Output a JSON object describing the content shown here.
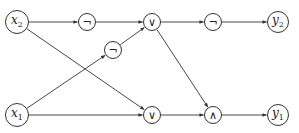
{
  "diagram": {
    "type": "boolean-circuit",
    "nodes": [
      {
        "id": "x2",
        "label": "x",
        "sub": "2",
        "kind": "input",
        "x": 17,
        "y": 22,
        "r": 12
      },
      {
        "id": "not1",
        "label": "¬",
        "kind": "gate",
        "x": 87,
        "y": 22,
        "r": 9
      },
      {
        "id": "or1",
        "label": "∨",
        "kind": "gate",
        "x": 152,
        "y": 22,
        "r": 9
      },
      {
        "id": "not3",
        "label": "¬",
        "kind": "gate",
        "x": 213,
        "y": 22,
        "r": 9
      },
      {
        "id": "y2",
        "label": "y",
        "sub": "2",
        "kind": "output",
        "x": 278,
        "y": 22,
        "r": 11
      },
      {
        "id": "not2",
        "label": "¬",
        "kind": "gate",
        "x": 113,
        "y": 50,
        "r": 9
      },
      {
        "id": "x1",
        "label": "x",
        "sub": "1",
        "kind": "input",
        "x": 17,
        "y": 115,
        "r": 12
      },
      {
        "id": "or2",
        "label": "∨",
        "kind": "gate",
        "x": 152,
        "y": 115,
        "r": 9
      },
      {
        "id": "and1",
        "label": "∧",
        "kind": "gate",
        "x": 213,
        "y": 115,
        "r": 9
      },
      {
        "id": "y1",
        "label": "y",
        "sub": "1",
        "kind": "output",
        "x": 278,
        "y": 115,
        "r": 11
      }
    ],
    "edges": [
      {
        "from": "x2",
        "to": "not1"
      },
      {
        "from": "x2",
        "to": "or2"
      },
      {
        "from": "not1",
        "to": "or1"
      },
      {
        "from": "x1",
        "to": "not2"
      },
      {
        "from": "not2",
        "to": "or1"
      },
      {
        "from": "x1",
        "to": "or2"
      },
      {
        "from": "or1",
        "to": "not3"
      },
      {
        "from": "or1",
        "to": "and1"
      },
      {
        "from": "not3",
        "to": "y2"
      },
      {
        "from": "or2",
        "to": "and1"
      },
      {
        "from": "and1",
        "to": "y1"
      }
    ]
  },
  "labels": {
    "x2": "x",
    "x2_sub": "2",
    "x1": "x",
    "x1_sub": "1",
    "y2": "y",
    "y2_sub": "2",
    "y1": "y",
    "y1_sub": "1",
    "not1": "¬",
    "not2": "¬",
    "not3": "¬",
    "or1": "∨",
    "or2": "∨",
    "and1": "∧"
  }
}
